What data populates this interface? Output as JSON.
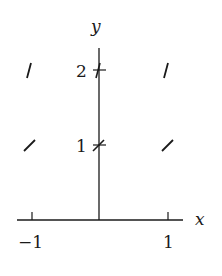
{
  "diagram": {
    "type": "slope_field",
    "axes": {
      "x_label": "x",
      "y_label": "y",
      "x_ticks": [
        {
          "value": -1,
          "label": "−1"
        },
        {
          "value": 1,
          "label": "1"
        }
      ],
      "y_ticks": [
        {
          "value": 1,
          "label": "1"
        },
        {
          "value": 2,
          "label": "2"
        }
      ]
    },
    "slope_segments": [
      {
        "x": -1,
        "y": 2,
        "slope": "steep"
      },
      {
        "x": 0,
        "y": 2,
        "slope": "steep"
      },
      {
        "x": 1,
        "y": 2,
        "slope": "steep"
      },
      {
        "x": -1,
        "y": 1,
        "slope": 1
      },
      {
        "x": 0,
        "y": 1,
        "slope": 1
      },
      {
        "x": 1,
        "y": 1,
        "slope": 1
      }
    ],
    "colors": {
      "ink": "#1a1a1a",
      "background": "#ffffff"
    }
  }
}
